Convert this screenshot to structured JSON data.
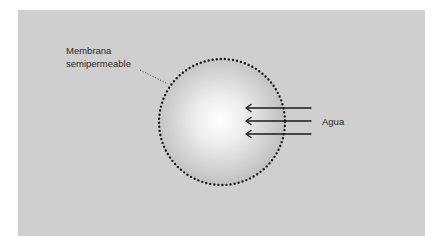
{
  "diagram": {
    "labels": {
      "membrane_line1": "Membrana",
      "membrane_line2": "semipermeable",
      "water": "Agua"
    },
    "colors": {
      "background": "#cfcfcf",
      "cell_center": "#ffffff",
      "cell_edge": "#b8b8b8",
      "membrane_dots": "#1a1a1a",
      "arrows": "#1a1a1a"
    },
    "arrows": {
      "count": 3,
      "direction": "into-cell (right to left)"
    }
  }
}
